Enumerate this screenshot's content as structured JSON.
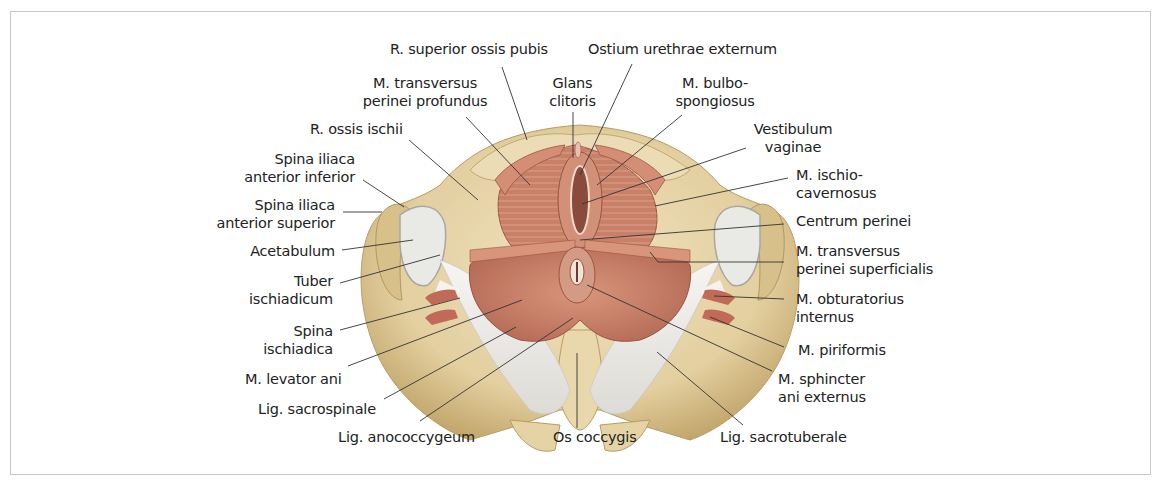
{
  "figure": {
    "colors": {
      "bone": "#e8d7b0",
      "bone_shadow": "#c9b07a",
      "muscle": "#c9826a",
      "muscle_dark": "#a85a48",
      "ligament": "#eeeeea",
      "leader_line": "#333333",
      "frame": "#c8c8c8"
    }
  },
  "labels": {
    "r_superior_ossis_pubis": "R. superior ossis pubis",
    "ostium_urethrae_externum": "Ostium urethrae externum",
    "m_transversus_perinei_profundus": [
      "M. transversus",
      "perinei profundus"
    ],
    "glans_clitoris": [
      "Glans",
      "clitoris"
    ],
    "m_bulbospongiosus": [
      "M. bulbo-",
      "spongiosus"
    ],
    "r_ossis_ischii": "R. ossis ischii",
    "vestibulum_vaginae": [
      "Vestibulum",
      "vaginae"
    ],
    "spina_iliaca_anterior_inferior": [
      "Spina iliaca",
      "anterior inferior"
    ],
    "m_ischiocavernosus": [
      "M. ischio-",
      "cavernosus"
    ],
    "spina_iliaca_anterior_superior": [
      "Spina iliaca",
      "anterior superior"
    ],
    "centrum_perinei": "Centrum perinei",
    "acetabulum": "Acetabulum",
    "m_transversus_perinei_superficialis": [
      "M. transversus",
      "perinei superficialis"
    ],
    "tuber_ischiadicum": [
      "Tuber",
      "ischiadicum"
    ],
    "m_obturatorius_internus": [
      "M. obturatorius",
      "internus"
    ],
    "spina_ischiadica": [
      "Spina",
      "ischiadica"
    ],
    "m_piriformis": "M. piriformis",
    "m_levator_ani": "M. levator ani",
    "m_sphincter_ani_externus": [
      "M. sphincter",
      "ani externus"
    ],
    "lig_sacrospinale": "Lig. sacrospinale",
    "lig_anococcygeum": "Lig. anococcygeum",
    "os_coccygis": "Os coccygis",
    "lig_sacrotuberale": "Lig. sacrotuberale"
  }
}
